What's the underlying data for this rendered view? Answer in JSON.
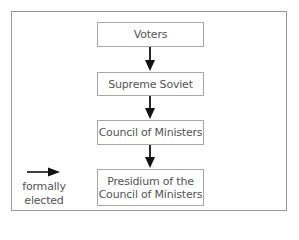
{
  "diagram": {
    "type": "flowchart",
    "direction": "top-to-bottom",
    "nodes": [
      {
        "id": "voters",
        "lines": [
          "Voters"
        ]
      },
      {
        "id": "supreme-soviet",
        "lines": [
          "Supreme Soviet"
        ]
      },
      {
        "id": "council-of-ministers",
        "lines": [
          "Council of Ministers"
        ]
      },
      {
        "id": "presidium",
        "lines": [
          "Presidium of the",
          "Council of Ministers"
        ]
      }
    ],
    "edges": [
      {
        "from": "voters",
        "to": "supreme-soviet",
        "meaning": "formally elected"
      },
      {
        "from": "supreme-soviet",
        "to": "council-of-ministers",
        "meaning": "formally elected"
      },
      {
        "from": "council-of-ministers",
        "to": "presidium",
        "meaning": "formally elected"
      }
    ],
    "legend": {
      "symbol": "arrow-right",
      "lines": [
        "formally",
        "elected"
      ]
    },
    "colors": {
      "frame_border": "#9a9a9a",
      "node_border": "#a8a8a8",
      "text": "#555555",
      "arrow": "#111111"
    }
  }
}
